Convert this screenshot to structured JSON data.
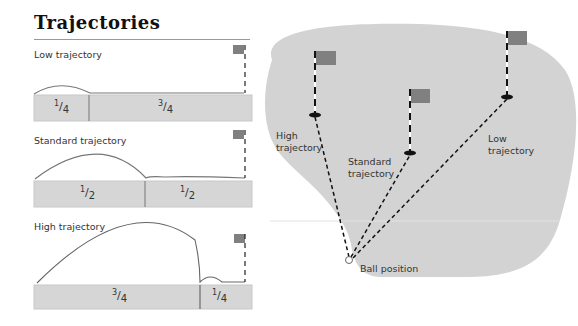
{
  "title": "Trajectories",
  "panels": [
    {
      "label": "Low trajectory",
      "segments": [
        {
          "num": "1",
          "den": "4"
        },
        {
          "num": "3",
          "den": "4"
        }
      ]
    },
    {
      "label": "Standard trajectory",
      "segments": [
        {
          "num": "1",
          "den": "2"
        },
        {
          "num": "1",
          "den": "2"
        }
      ]
    },
    {
      "label": "High trajectory",
      "segments": [
        {
          "num": "3",
          "den": "4"
        },
        {
          "num": "1",
          "den": "4"
        }
      ]
    }
  ],
  "map": {
    "labels": {
      "high": "High trajectory",
      "high_l1": "High",
      "high_l2": "trajectory",
      "standard_l1": "Standard",
      "standard_l2": "trajectory",
      "low_l1": "Low",
      "low_l2": "trajectory",
      "ball": "Ball position"
    }
  },
  "colors": {
    "green": "#d4d4d4",
    "bar": "#d6d6d6",
    "flag": "#808080",
    "line": "#777777"
  }
}
